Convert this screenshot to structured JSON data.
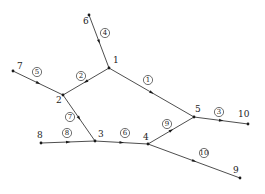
{
  "diagram": {
    "type": "directed-network-graph",
    "nodes": [
      {
        "id": "1",
        "label": "1",
        "x": 109,
        "y": 68,
        "lx": 4,
        "ly": -5
      },
      {
        "id": "2",
        "label": "2",
        "x": 63,
        "y": 95,
        "lx": -7,
        "ly": 8
      },
      {
        "id": "3",
        "label": "3",
        "x": 95,
        "y": 141,
        "lx": 3,
        "ly": -4
      },
      {
        "id": "4",
        "label": "4",
        "x": 148,
        "y": 144,
        "lx": -5,
        "ly": -4
      },
      {
        "id": "5",
        "label": "5",
        "x": 194,
        "y": 117,
        "lx": 1,
        "ly": -5
      },
      {
        "id": "6",
        "label": "6",
        "x": 89,
        "y": 15,
        "lx": -6,
        "ly": 9
      },
      {
        "id": "7",
        "label": "7",
        "x": 13,
        "y": 71,
        "lx": 4,
        "ly": -2
      },
      {
        "id": "8",
        "label": "8",
        "x": 41,
        "y": 143,
        "lx": -4,
        "ly": -5
      },
      {
        "id": "9",
        "label": "9",
        "x": 240,
        "y": 178,
        "lx": -7,
        "ly": -5
      },
      {
        "id": "10",
        "label": "10",
        "x": 248,
        "y": 124,
        "lx": -10,
        "ly": -7
      }
    ],
    "edges": [
      {
        "id": "e1",
        "label": "1",
        "from": "1",
        "to": "5",
        "cx": 148,
        "cy": 80
      },
      {
        "id": "e2",
        "label": "2",
        "from": "1",
        "to": "2",
        "cx": 81,
        "cy": 76
      },
      {
        "id": "e3",
        "label": "3",
        "from": "5",
        "to": "10",
        "cx": 219,
        "cy": 112
      },
      {
        "id": "e4",
        "label": "4",
        "from": "6",
        "to": "1",
        "cx": 105,
        "cy": 33
      },
      {
        "id": "e5",
        "label": "5",
        "from": "7",
        "to": "2",
        "cx": 37,
        "cy": 72
      },
      {
        "id": "e6",
        "label": "6",
        "from": "3",
        "to": "4",
        "cx": 125,
        "cy": 133
      },
      {
        "id": "e7",
        "label": "7",
        "from": "2",
        "to": "3",
        "cx": 70,
        "cy": 117
      },
      {
        "id": "e8",
        "label": "8",
        "from": "8",
        "to": "3",
        "cx": 67,
        "cy": 133
      },
      {
        "id": "e9",
        "label": "9",
        "from": "4",
        "to": "5",
        "cx": 167,
        "cy": 124
      },
      {
        "id": "e10",
        "label": "10",
        "from": "4",
        "to": "9",
        "cx": 204,
        "cy": 153
      }
    ]
  }
}
